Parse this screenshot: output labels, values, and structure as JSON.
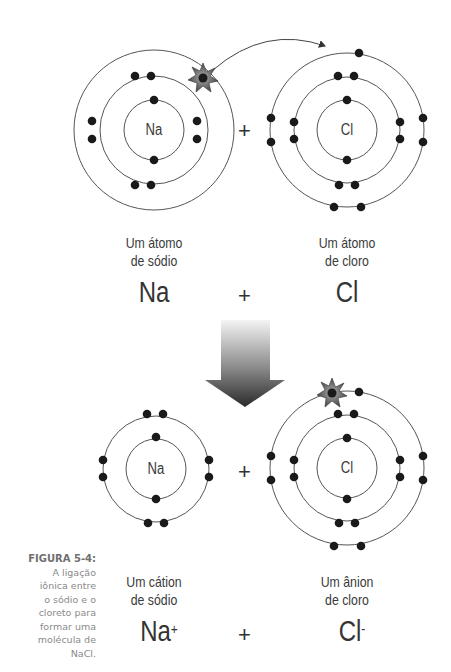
{
  "caption": {
    "heading": "FIGURA 5-4:",
    "lines": [
      "A ligação",
      "iônica entre",
      "o sódio e o",
      "cloreto para",
      "formar uma",
      "molécula de",
      "NaCl."
    ]
  },
  "top": {
    "sodium_atom": {
      "symbol": "Na",
      "label_line1": "Um átomo",
      "label_line2": "de sódio",
      "formula": "Na"
    },
    "chlorine_atom": {
      "symbol": "Cl",
      "label_line1": "Um átomo",
      "label_line2": "de cloro",
      "formula": "Cl"
    },
    "plus_between_atoms": "+",
    "plus_formula": "+"
  },
  "bottom": {
    "sodium_ion": {
      "symbol": "Na",
      "label_line1": "Um cátion",
      "label_line2": "de sódio",
      "formula": "Na",
      "charge": "+"
    },
    "chloride_ion": {
      "symbol": "Cl",
      "label_line1": "Um ânion",
      "label_line2": "de cloro",
      "formula": "Cl",
      "charge": "-"
    },
    "plus_between_atoms": "+",
    "plus_formula": "+"
  },
  "colors": {
    "orbit": "#555555",
    "electron": "#1a1a1a",
    "text": "#333333",
    "caption": "#8a8a8a",
    "arrow_top": "#f2f2f2",
    "arrow_bottom": "#2e2e2e"
  }
}
